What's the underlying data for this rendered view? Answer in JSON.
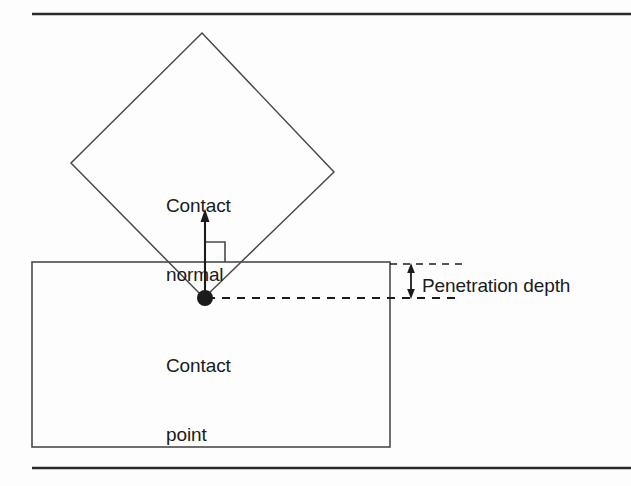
{
  "figure": {
    "background_color": "#fdfdfd",
    "stroke_color": "#4a4a4a",
    "rule_color": "#2b2b2b",
    "text_color": "#1b1b1b",
    "labels": {
      "contact_normal": "Contact\nnormal",
      "contact_normal_line1": "Contact",
      "contact_normal_line2": "normal",
      "contact_point": "Contact\npoint",
      "contact_point_line1": "Contact",
      "contact_point_line2": "point",
      "penetration_depth": "Penetration depth"
    },
    "shapes": {
      "diamond": {
        "name": "rotated-square-body",
        "points": "202,33 334,172 204,298 71,163"
      },
      "box": {
        "name": "static-box-body",
        "x": 32,
        "y": 262,
        "width": 358,
        "height": 185
      },
      "contact_point_marker": {
        "cx": 205,
        "cy": 298,
        "r": 8
      },
      "normal_arrow": {
        "x": 205,
        "y_tail": 298,
        "y_head": 212
      },
      "right_angle_marker": {
        "x": 205,
        "y": 242,
        "size": 20
      },
      "surface_dashed_line": {
        "y": 264,
        "x_start": 390,
        "x_end": 462
      },
      "penetration_dashed_line": {
        "y": 298,
        "x_start": 207,
        "x_end": 462
      },
      "penetration_arrow": {
        "x": 411,
        "y_top": 264,
        "y_bottom": 298
      },
      "top_rule": {
        "y": 14,
        "x_start": 32,
        "x_end": 631
      },
      "bottom_rule": {
        "y": 468,
        "x_start": 32,
        "x_end": 631
      }
    }
  }
}
